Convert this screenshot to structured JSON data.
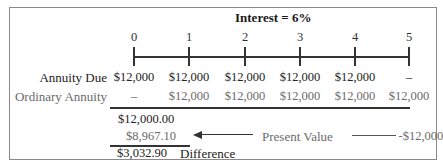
{
  "title": "Interest = 6%",
  "timeline": {
    "ticks": [
      "0",
      "1",
      "2",
      "3",
      "4",
      "5"
    ]
  },
  "rows": {
    "annuity_due": {
      "label": "Annuity Due",
      "values": [
        "$12,000",
        "$12,000",
        "$12,000",
        "$12,000",
        "$12,000",
        "–"
      ]
    },
    "ordinary_annuity": {
      "label": "Ordinary Annuity",
      "values": [
        "–",
        "$12,000",
        "$12,000",
        "$12,000",
        "$12,000",
        "$12,000"
      ]
    }
  },
  "calculation": {
    "line1": "$12,000.00",
    "line2": "$8,967.10",
    "difference_value": "$3,032.90",
    "difference_label": "Difference",
    "present_value_label": "Present Value",
    "present_value_source": "-$12,000"
  },
  "colors": {
    "line": "#333333",
    "ordinary_text": "#6b6b6b",
    "frame": "#8a8a8a"
  }
}
